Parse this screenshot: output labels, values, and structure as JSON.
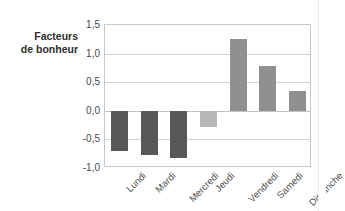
{
  "chart_data": {
    "type": "bar",
    "title": "",
    "subtitle": "",
    "xlabel": "",
    "ylabel": "Facteurs de bonheur",
    "ylabel_lines": [
      "Facteurs",
      "de bonheur"
    ],
    "categories": [
      "Lundi",
      "Mardi",
      "Mercredi",
      "Jeudi",
      "Vendredi",
      "Samedi",
      "Dimanche"
    ],
    "values": [
      -0.7,
      -0.77,
      -0.83,
      -0.28,
      1.26,
      0.79,
      0.35
    ],
    "bar_colors": [
      "#585858",
      "#585858",
      "#585858",
      "#b8b8b8",
      "#909090",
      "#909090",
      "#909090"
    ],
    "ylim": [
      -1.0,
      1.5
    ],
    "yticks": [
      1.5,
      1.0,
      0.5,
      0.0,
      -0.5,
      -1.0
    ],
    "ytick_labels": [
      "1,5",
      "1,0",
      "0,5",
      "0,0",
      "-0,5",
      "-1,0"
    ],
    "grid": true,
    "grid_axis": "y",
    "legend": false,
    "legend_position": "none",
    "xtick_rotation": -45,
    "decimal_separator": ","
  },
  "colors": {
    "negative_bar": "#585858",
    "positive_bar": "#909090",
    "highlight_bar": "#b8b8b8",
    "gridline": "#d2d2d2",
    "frame": "#c9c9c9",
    "text": "#3a3a3a",
    "background": "#ffffff"
  }
}
